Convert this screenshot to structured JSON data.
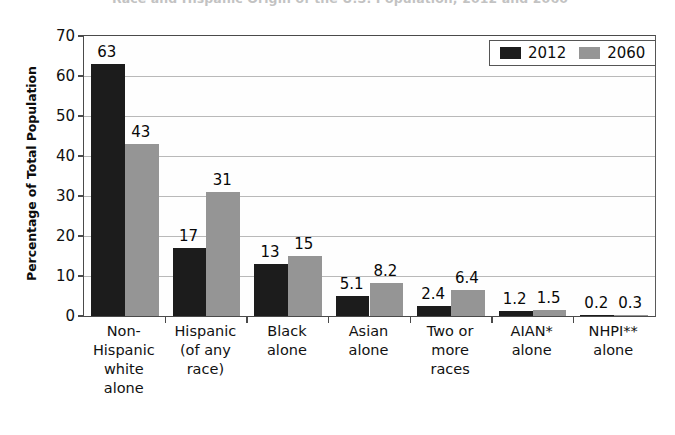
{
  "chart_data": {
    "type": "bar",
    "title": "Race and Hispanic Origin of the U.S. Population, 2012 and 2060",
    "xlabel": "",
    "ylabel": "Percentage of Total Population",
    "ylim": [
      0,
      70
    ],
    "yticks": [
      0,
      10,
      20,
      30,
      40,
      50,
      60,
      70
    ],
    "ytick_labels": [
      "0",
      "10",
      "20",
      "30",
      "40",
      "50",
      "60",
      "70"
    ],
    "grid": true,
    "legend_position": "top-right",
    "categories": [
      "Non-\nHispanic\nwhite\nalone",
      "Hispanic\n(of any\nrace)",
      "Black\nalone",
      "Asian\nalone",
      "Two or\nmore\nraces",
      "AIAN*\nalone",
      "NHPI**\nalone"
    ],
    "series": [
      {
        "name": "2012",
        "color": "#1c1c1c",
        "values": [
          63,
          17,
          13,
          5.1,
          2.4,
          1.2,
          0.2
        ],
        "labels": [
          "63",
          "17",
          "13",
          "5.1",
          "2.4",
          "1.2",
          "0.2"
        ]
      },
      {
        "name": "2060",
        "color": "#959595",
        "values": [
          43,
          31,
          15,
          8.2,
          6.4,
          1.5,
          0.3
        ],
        "labels": [
          "43",
          "31",
          "15",
          "8.2",
          "6.4",
          "1.5",
          "0.3"
        ]
      }
    ]
  }
}
